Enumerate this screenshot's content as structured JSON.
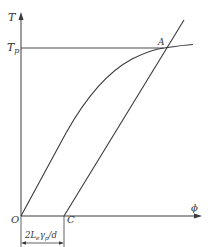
{
  "diagram": {
    "type": "stress-strain style plot",
    "axes": {
      "y_label": "T",
      "x_label": "ϕ",
      "origin_label": "O"
    },
    "levels": {
      "tp_label_main": "T",
      "tp_label_sub": "p"
    },
    "points": {
      "A": "A",
      "C": "C"
    },
    "dimension": {
      "prefix": "2L",
      "sub1": "e",
      "mid": "γ",
      "sub2": "p",
      "suffix": "/d"
    },
    "colors": {
      "line": "#3a3a3a",
      "text": "#333333",
      "background": "#ffffff"
    }
  }
}
